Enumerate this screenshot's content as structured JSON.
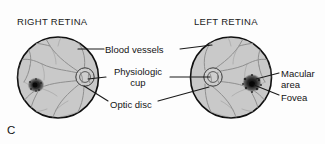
{
  "figure": {
    "panel_letter": "C",
    "headings": [
      {
        "id": "right-retina",
        "text": "RIGHT RETINA"
      },
      {
        "id": "left-retina",
        "text": "LEFT RETINA"
      }
    ],
    "labels": {
      "blood_vessels": "Blood vessels",
      "physiologic_line1": "Physiologic",
      "physiologic_line2": "cup",
      "optic_disc": "Optic disc",
      "macular_line1": "Macular",
      "macular_line2": "area",
      "fovea": "Fovea"
    }
  },
  "colors": {
    "retina_fill": "#c9c9c9",
    "retina_outline": "#101010",
    "vessel": "#8d8d8d",
    "macula_dark": "#1f1f1f",
    "disc_fill": "#d6d6d6",
    "leader_line": "#1a1a1a",
    "text": "#141414",
    "background": "#fdfdfd"
  },
  "geometry": {
    "right_retina": {
      "cx": 58,
      "cy": 77.5,
      "r": 41
    },
    "left_retina": {
      "cx": 231,
      "cy": 77.5,
      "r": 41
    },
    "right_optic_disc": {
      "cx": 85,
      "cy": 77,
      "r": 9
    },
    "left_optic_disc": {
      "cx": 213,
      "cy": 77,
      "r": 9
    },
    "right_macula": {
      "cx": 36,
      "cy": 85,
      "r": 8
    },
    "left_macula": {
      "cx": 252,
      "cy": 83,
      "r": 9
    }
  }
}
